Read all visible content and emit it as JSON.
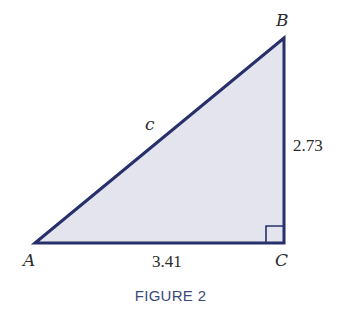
{
  "figure": {
    "caption": "FIGURE 2",
    "colors": {
      "stroke": "#27306b",
      "fill": "#e3e4ee",
      "caption": "#3b4a7a",
      "label": "#2b2b2b"
    },
    "triangle": {
      "type": "right-triangle",
      "right_angle_at": "C",
      "vertices": [
        {
          "name": "A",
          "label": "A"
        },
        {
          "name": "B",
          "label": "B"
        },
        {
          "name": "C",
          "label": "C"
        }
      ],
      "sides": {
        "AB": {
          "label": "c"
        },
        "BC": {
          "label": "2.73"
        },
        "AC": {
          "label": "3.41"
        }
      }
    }
  }
}
